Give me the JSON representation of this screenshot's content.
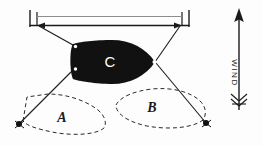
{
  "diagram": {
    "background_color": "#fdfdfd",
    "ink_color": "#1a1a1a",
    "net_fill_color": "#111111",
    "labels": {
      "net_current": "C",
      "ghost_left": "A",
      "ghost_right": "B",
      "wind": "WIND"
    },
    "wind_arrow": {
      "direction": "up",
      "label": "WIND",
      "label_orientation": "vertical-clockwise"
    },
    "elements": {
      "top_beam_name": "vessel-beam",
      "net_name": "net-shape-c",
      "ghost_a_name": "ghost-outline-a",
      "ghost_b_name": "ghost-outline-b",
      "warp_lines": 4,
      "anchor_markers": 2
    }
  }
}
